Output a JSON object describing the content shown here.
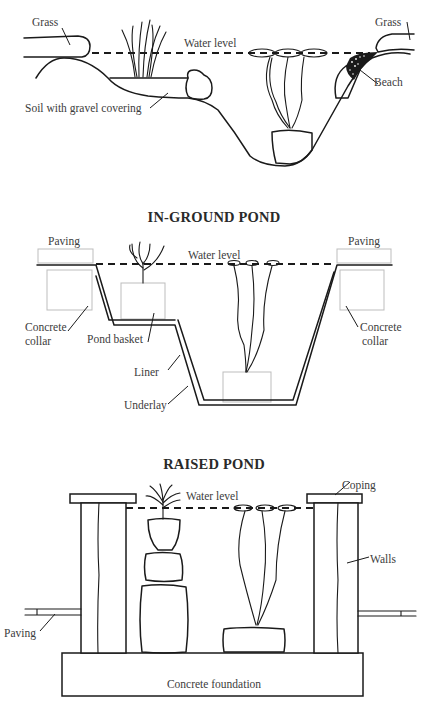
{
  "diagrams": [
    {
      "id": "natural-pond",
      "title": "",
      "labels": {
        "grass_left": "Grass",
        "water_level": "Water level",
        "grass_right": "Grass",
        "beach": "Beach",
        "soil": "Soil with gravel covering"
      }
    },
    {
      "id": "in-ground-pond",
      "title": "IN-GROUND POND",
      "labels": {
        "paving_left": "Paving",
        "water_level": "Water level",
        "paving_right": "Paving",
        "collar_left_1": "Concrete",
        "collar_left_2": "collar",
        "pond_basket": "Pond basket",
        "collar_right_1": "Concrete",
        "collar_right_2": "collar",
        "liner": "Liner",
        "underlay": "Underlay"
      }
    },
    {
      "id": "raised-pond",
      "title": "RAISED POND",
      "labels": {
        "water_level": "Water level",
        "coping": "Coping",
        "walls": "Walls",
        "paving": "Paving",
        "foundation": "Concrete foundation"
      }
    }
  ],
  "colors": {
    "line": "#1a1a1a",
    "label": "#3c3c3c",
    "faint_box": "#bdbdbd",
    "background": "#ffffff"
  }
}
